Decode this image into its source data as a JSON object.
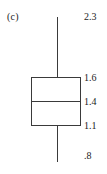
{
  "figure": {
    "panel_label": "(c)",
    "background_color": "#ffffff",
    "line_color": "#3a3a3a",
    "text_color": "#1c1c1c"
  },
  "labels": {
    "max": "2.3",
    "q3": "1.6",
    "median": "1.4",
    "q1": "1.1",
    "min": ".8"
  },
  "chart_data": {
    "type": "box",
    "title": "",
    "subtitle": "",
    "xlabel": "",
    "ylabel": "",
    "grid": false,
    "legend": null,
    "panel_label": "(c)",
    "orientation": "vertical",
    "axis_visible": false,
    "label_position": "right-of-box",
    "ylim": [
      0.8,
      2.3
    ],
    "series": [
      {
        "name": "(c)",
        "whisker_high": 2.3,
        "q3": 1.6,
        "median": 1.4,
        "q1": 1.1,
        "whisker_low": 0.8,
        "iqr": 0.5,
        "outliers": [],
        "caps": false
      }
    ],
    "annotations": [
      {
        "text": "2.3",
        "value": 2.3,
        "anchor": "whisker-high"
      },
      {
        "text": "1.6",
        "value": 1.6,
        "anchor": "q3"
      },
      {
        "text": "1.4",
        "value": 1.4,
        "anchor": "median"
      },
      {
        "text": "1.1",
        "value": 1.1,
        "anchor": "q1"
      },
      {
        "text": ".8",
        "value": 0.8,
        "anchor": "whisker-low"
      }
    ]
  }
}
